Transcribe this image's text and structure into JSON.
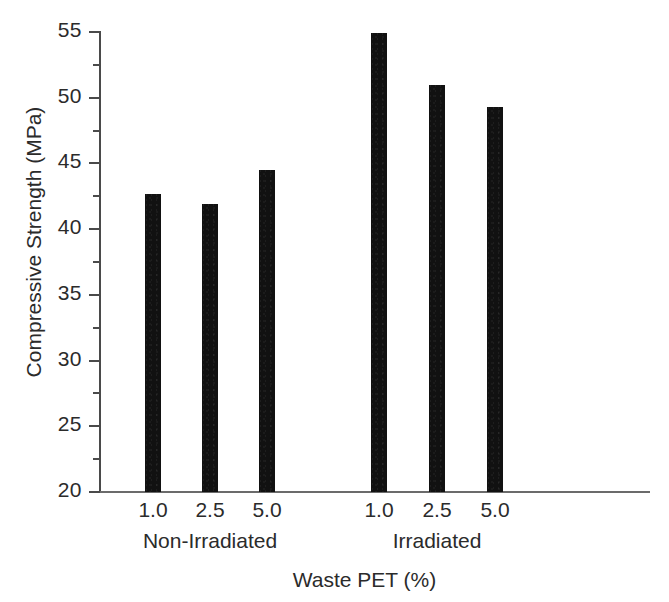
{
  "chart_data": {
    "type": "bar",
    "title": "",
    "xlabel": "Waste PET (%)",
    "ylabel": "Compressive Strength (MPa)",
    "ylim": [
      20,
      55
    ],
    "ytick_labels": [
      "20",
      "25",
      "30",
      "35",
      "40",
      "45",
      "50",
      "55"
    ],
    "ytick_values": [
      20,
      25,
      30,
      35,
      40,
      45,
      50,
      55
    ],
    "yminor_values": [
      22.5,
      27.5,
      32.5,
      37.5,
      42.5,
      47.5,
      52.5
    ],
    "grid": false,
    "legend": "none",
    "bar_color": "#111111",
    "groups": [
      {
        "name": "Non-Irradiated",
        "categories": [
          "1.0",
          "2.5",
          "5.0"
        ],
        "values": [
          42.7,
          41.9,
          44.5
        ]
      },
      {
        "name": "Irradiated",
        "categories": [
          "1.0",
          "2.5",
          "5.0"
        ],
        "values": [
          54.9,
          51.0,
          49.3
        ]
      }
    ],
    "categories": [
      "1.0",
      "2.5",
      "5.0",
      "1.0",
      "2.5",
      "5.0"
    ],
    "values": [
      42.7,
      41.9,
      44.5,
      54.9,
      51.0,
      49.3
    ]
  },
  "bars": [
    {
      "label": "1.0",
      "group": "Non-Irradiated",
      "value": 42.7,
      "left": 145,
      "width": 16
    },
    {
      "label": "2.5",
      "group": "Non-Irradiated",
      "value": 41.9,
      "left": 202,
      "width": 16
    },
    {
      "label": "5.0",
      "group": "Non-Irradiated",
      "value": 44.5,
      "left": 259,
      "width": 16
    },
    {
      "label": "1.0",
      "group": "Irradiated",
      "value": 54.9,
      "left": 371,
      "width": 16
    },
    {
      "label": "2.5",
      "group": "Irradiated",
      "value": 51.0,
      "left": 429,
      "width": 16
    },
    {
      "label": "5.0",
      "group": "Irradiated",
      "value": 49.3,
      "left": 487,
      "width": 16
    }
  ],
  "group_labels": [
    {
      "text": "Non-Irradiated",
      "center": 210
    },
    {
      "text": "Irradiated",
      "center": 437
    }
  ],
  "axes": {
    "x_title": "Waste PET (%)",
    "y_title": "Compressive Strength (MPa)"
  }
}
